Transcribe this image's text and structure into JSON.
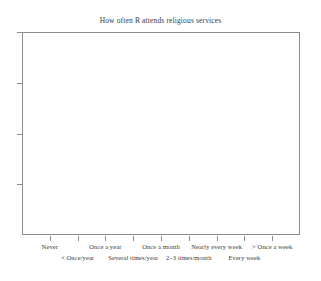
{
  "chart_data": {
    "type": "bar",
    "title": "How often R attends religious services",
    "xlabel": "",
    "ylabel": "",
    "grid": false,
    "legend": null,
    "categories": [
      "Never",
      "< Once/year",
      "Once a year",
      "Several times/year",
      "Once a month",
      "2–3 times/month",
      "Nearly every week",
      "Every week",
      "> Once a week"
    ],
    "values": [
      null,
      null,
      null,
      null,
      null,
      null,
      null,
      null,
      null
    ],
    "series": [
      {
        "name": "How often R attends religious services",
        "values": [
          null,
          null,
          null,
          null,
          null,
          null,
          null,
          null,
          null
        ]
      }
    ],
    "note": "Empty plot frame: axes and category labels drawn, no bars rendered.",
    "x_tick_count": 9,
    "y_tick_count": 4,
    "y_tick_labels": [
      "",
      "",
      "",
      ""
    ],
    "ylim": [
      null,
      null
    ]
  },
  "figure": {
    "title": "How often R attends religious services",
    "background_color": "#ffffff",
    "axis_color": "#8c8c8c",
    "text_color": "#3a3a3a"
  },
  "axes": {
    "x": {
      "labels_row_top": [
        {
          "text": "Never",
          "index": 0
        },
        {
          "text": "Once a year",
          "index": 2
        },
        {
          "text": "Once a month",
          "index": 4
        },
        {
          "text": "Nearly every week",
          "index": 6
        },
        {
          "text": "> Once a week",
          "index": 8
        }
      ],
      "labels_row_bottom": [
        {
          "text": "< Once/year",
          "index": 1
        },
        {
          "text": "Several times/year",
          "index": 3
        },
        {
          "text": "2–3 times/month",
          "index": 5
        },
        {
          "text": "Every week",
          "index": 7
        }
      ]
    },
    "y": {
      "labels": []
    }
  }
}
